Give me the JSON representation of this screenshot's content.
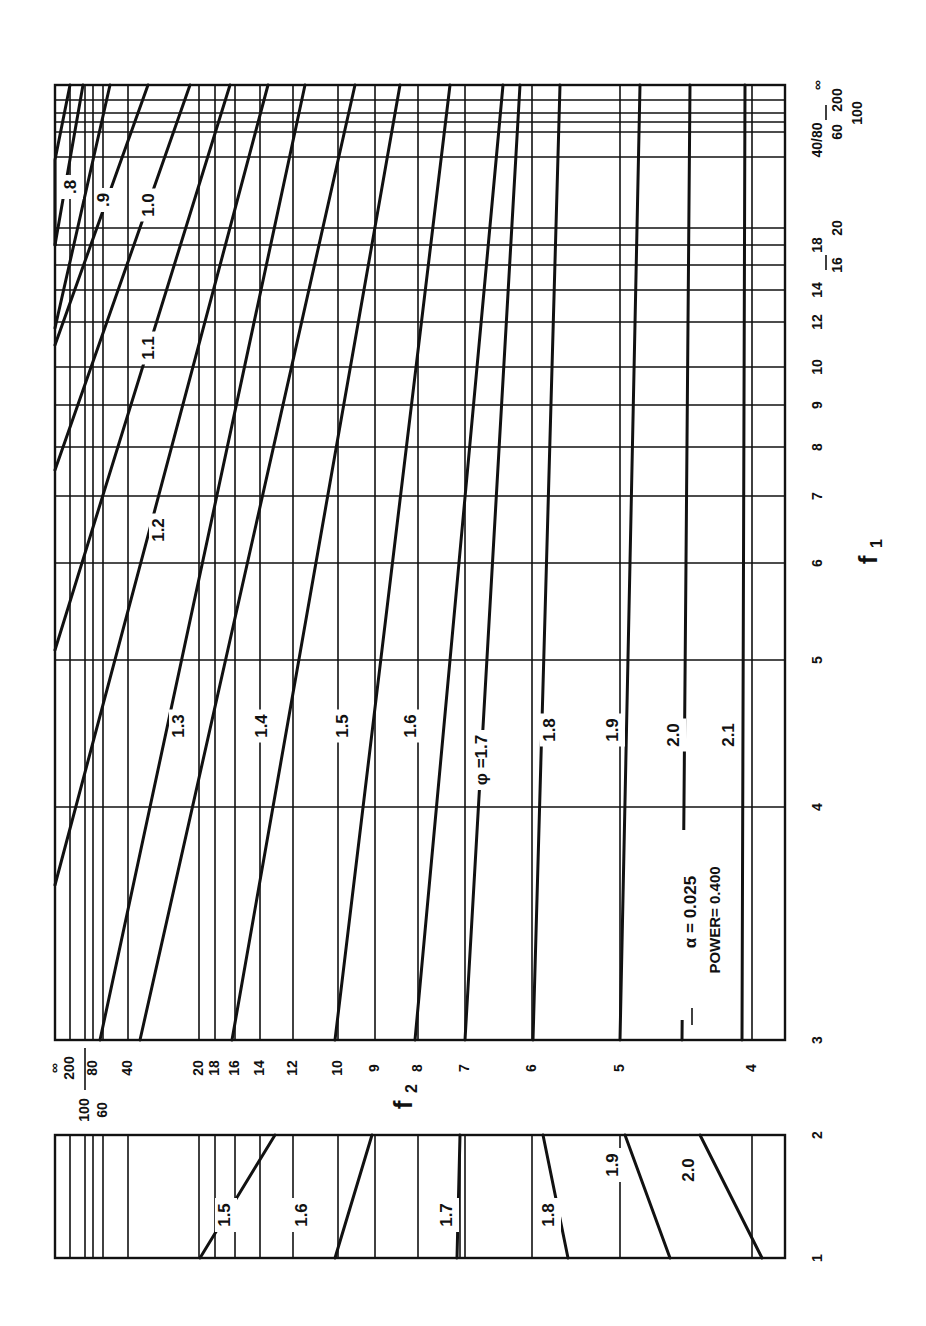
{
  "chart_data": [
    {
      "type": "line",
      "title": "Power nomograph (main panel, f1 from 3 to infinity)",
      "orientation": "rotated 90 degrees clockwise",
      "annotation": [
        "α = 0.025",
        "POWER= 0.400"
      ],
      "xlabel": "f1",
      "ylabel": "f2",
      "f1_ticks": [
        "3",
        "4",
        "5",
        "6",
        "7",
        "8",
        "9",
        "10",
        "12",
        "14",
        "16",
        "18",
        "20",
        "40",
        "60",
        "80",
        "100",
        "200",
        "∞"
      ],
      "f2_ticks": [
        "4",
        "5",
        "6",
        "7",
        "8",
        "9",
        "10",
        "12",
        "14",
        "16",
        "18",
        "20",
        "40",
        "60",
        "80",
        "100",
        "200",
        "∞"
      ],
      "legend_title": "φ",
      "series": [
        {
          "name": "φ=.8",
          "label": ".8"
        },
        {
          "name": "φ=.9",
          "label": ".9"
        },
        {
          "name": "φ=1.0",
          "label": "1.0"
        },
        {
          "name": "φ=1.1",
          "label": "1.1"
        },
        {
          "name": "φ=1.2",
          "label": "1.2"
        },
        {
          "name": "φ=1.3",
          "label": "1.3"
        },
        {
          "name": "φ=1.4",
          "label": "1.4"
        },
        {
          "name": "φ=1.5",
          "label": "1.5"
        },
        {
          "name": "φ=1.6",
          "label": "1.6"
        },
        {
          "name": "φ=1.7",
          "label": "φ=1.7"
        },
        {
          "name": "φ=1.8",
          "label": "1.8"
        },
        {
          "name": "φ=1.9",
          "label": "1.9"
        },
        {
          "name": "φ=2.0",
          "label": "2.0"
        },
        {
          "name": "φ=2.1",
          "label": "2.1"
        }
      ],
      "grid": true
    },
    {
      "type": "line",
      "title": "Power nomograph (lower panel, f1 from 1 to 2)",
      "xlabel": "f1",
      "ylabel": "f2",
      "f1_ticks": [
        "1",
        "2"
      ],
      "series": [
        {
          "name": "φ=1.5",
          "label": "1.5"
        },
        {
          "name": "φ=1.6",
          "label": "1.6"
        },
        {
          "name": "φ=1.7",
          "label": "1.7"
        },
        {
          "name": "φ=1.8",
          "label": "1.8"
        },
        {
          "name": "φ=1.9",
          "label": "1.9"
        },
        {
          "name": "φ=2.0",
          "label": "2.0"
        }
      ],
      "grid": true
    }
  ],
  "render": {
    "main": {
      "x0": 55,
      "x1": 785,
      "y0": 85,
      "y1": 1040
    },
    "main_vgrid_x": [
      70,
      85,
      93,
      103,
      128,
      199,
      215,
      235,
      260,
      293,
      338,
      375,
      418,
      465,
      532,
      620,
      752
    ],
    "main_hgrid_y": [
      100,
      113,
      122,
      132,
      157,
      228,
      245,
      265,
      290,
      322,
      367,
      405,
      447,
      496,
      563,
      660,
      807
    ],
    "main_curves": [
      {
        "label": ".8",
        "pts": [
          [
            55,
            245
          ],
          [
            83,
            85
          ]
        ]
      },
      {
        "label": ".9",
        "pts": [
          [
            55,
            245
          ],
          [
            55,
            245
          ],
          [
            55,
            245
          ],
          [
            55,
            245
          ],
          [
            55,
            160
          ],
          [
            70,
            85
          ]
        ]
      },
      {
        "label": "1.0",
        "pts": [
          [
            55,
            328
          ],
          [
            110,
            85
          ]
        ]
      },
      {
        "label": "1.1",
        "pts": [
          [
            55,
            345
          ],
          [
            148,
            85
          ]
        ]
      },
      {
        "label": "1.2",
        "pts": [
          [
            55,
            470
          ],
          [
            190,
            85
          ]
        ]
      },
      {
        "label": "1.3",
        "pts": [
          [
            55,
            650
          ],
          [
            230,
            85
          ]
        ]
      },
      {
        "label": "1.4",
        "pts": [
          [
            55,
            885
          ],
          [
            268,
            85
          ]
        ]
      },
      {
        "label": "1.5",
        "pts": [
          [
            100,
            1040
          ],
          [
            305,
            85
          ]
        ]
      },
      {
        "label": "1.6",
        "pts": [
          [
            140,
            1040
          ],
          [
            355,
            85
          ]
        ]
      },
      {
        "label": "1.7",
        "pts": [
          [
            232,
            1040
          ],
          [
            400,
            85
          ]
        ]
      },
      {
        "label": "1.8",
        "pts": [
          [
            335,
            1040
          ],
          [
            450,
            85
          ]
        ]
      },
      {
        "label": "1.9",
        "pts": [
          [
            415,
            1040
          ],
          [
            503,
            85
          ]
        ]
      },
      {
        "label": "2.0",
        "pts": [
          [
            465,
            1040
          ],
          [
            520,
            85
          ]
        ]
      },
      {
        "label": "2.1",
        "pts": [
          [
            533,
            1040
          ],
          [
            560,
            85
          ]
        ]
      },
      {
        "label": "2.2",
        "pts": [
          [
            620,
            1040
          ],
          [
            640,
            85
          ]
        ]
      },
      {
        "label": "2.3",
        "pts": [
          [
            682,
            1040
          ],
          [
            690,
            85
          ]
        ]
      },
      {
        "label": "2.4",
        "pts": [
          [
            742,
            1040
          ],
          [
            745,
            85
          ]
        ]
      }
    ],
    "main_labels": [
      {
        "text": ".8",
        "x": 72,
        "y": 187
      },
      {
        "text": ".9",
        "x": 105,
        "y": 200
      },
      {
        "text": "1.0",
        "x": 150,
        "y": 205
      },
      {
        "text": "1.1",
        "x": 150,
        "y": 348
      },
      {
        "text": "1.2",
        "x": 160,
        "y": 530
      },
      {
        "text": "1.3",
        "x": 180,
        "y": 726
      },
      {
        "text": "1.4",
        "x": 263,
        "y": 726
      },
      {
        "text": "1.5",
        "x": 344,
        "y": 726
      },
      {
        "text": "1.6",
        "x": 412,
        "y": 726
      },
      {
        "text": "φ =1.7",
        "x": 483,
        "y": 760
      },
      {
        "text": "1.8",
        "x": 551,
        "y": 730
      },
      {
        "text": "1.9",
        "x": 614,
        "y": 730
      },
      {
        "text": "2.0",
        "x": 675,
        "y": 735
      },
      {
        "text": "2.1",
        "x": 730,
        "y": 735
      }
    ],
    "lower": {
      "x0": 55,
      "x1": 785,
      "y0": 1135,
      "y1": 1258
    },
    "lower_vgrid_x": [
      70,
      85,
      93,
      103,
      128,
      199,
      215,
      235,
      260,
      293,
      338,
      375,
      418,
      460,
      465,
      532,
      620,
      752
    ],
    "lower_curves": [
      {
        "label": "1.5",
        "pts": [
          [
            200,
            1258
          ],
          [
            275,
            1135
          ]
        ]
      },
      {
        "label": "1.6",
        "pts": [
          [
            335,
            1258
          ],
          [
            372,
            1135
          ]
        ]
      },
      {
        "label": "1.7",
        "pts": [
          [
            457,
            1258
          ],
          [
            460,
            1135
          ]
        ]
      },
      {
        "label": "1.8",
        "pts": [
          [
            568,
            1258
          ],
          [
            543,
            1135
          ]
        ]
      },
      {
        "label": "1.9",
        "pts": [
          [
            670,
            1258
          ],
          [
            625,
            1135
          ]
        ]
      },
      {
        "label": "2.0",
        "pts": [
          [
            762,
            1258
          ],
          [
            700,
            1135
          ]
        ]
      }
    ],
    "lower_labels": [
      {
        "text": "1.5",
        "x": 226,
        "y": 1215
      },
      {
        "text": "1.6",
        "x": 303,
        "y": 1215
      },
      {
        "text": "1.7",
        "x": 448,
        "y": 1215
      },
      {
        "text": "1.8",
        "x": 550,
        "y": 1215
      },
      {
        "text": "1.9",
        "x": 614,
        "y": 1165
      },
      {
        "text": "2.0",
        "x": 690,
        "y": 1170
      }
    ],
    "f1_axis_labels": [
      {
        "text": "3",
        "x": 818,
        "y": 1040
      },
      {
        "text": "4",
        "x": 818,
        "y": 807
      },
      {
        "text": "5",
        "x": 818,
        "y": 660
      },
      {
        "text": "6",
        "x": 818,
        "y": 563
      },
      {
        "text": "7",
        "x": 818,
        "y": 496
      },
      {
        "text": "8",
        "x": 818,
        "y": 447
      },
      {
        "text": "9",
        "x": 818,
        "y": 405
      },
      {
        "text": "10",
        "x": 818,
        "y": 367
      },
      {
        "text": "12",
        "x": 818,
        "y": 322
      },
      {
        "text": "14",
        "x": 818,
        "y": 290
      },
      {
        "text": "16",
        "x": 838,
        "y": 265
      },
      {
        "text": "18",
        "x": 818,
        "y": 245
      },
      {
        "text": "20",
        "x": 838,
        "y": 228
      },
      {
        "text": "40/80",
        "x": 818,
        "y": 140
      },
      {
        "text": "60",
        "x": 838,
        "y": 132
      },
      {
        "text": "100",
        "x": 858,
        "y": 113
      },
      {
        "text": "200",
        "x": 838,
        "y": 100
      },
      {
        "text": "∞",
        "x": 818,
        "y": 85
      }
    ],
    "f1_lower_labels": [
      {
        "text": "2",
        "x": 818,
        "y": 1135
      },
      {
        "text": "1",
        "x": 818,
        "y": 1258
      }
    ],
    "f2_axis_labels": [
      {
        "text": "∞",
        "x": 55,
        "y": 1058
      },
      {
        "text": "200",
        "x": 70,
        "y": 1058
      },
      {
        "text": "80",
        "x": 93,
        "y": 1058
      },
      {
        "text": "40",
        "x": 128,
        "y": 1058
      },
      {
        "text": "20",
        "x": 199,
        "y": 1058
      },
      {
        "text": "18",
        "x": 215,
        "y": 1058
      },
      {
        "text": "16",
        "x": 235,
        "y": 1058
      },
      {
        "text": "14",
        "x": 260,
        "y": 1058
      },
      {
        "text": "12",
        "x": 293,
        "y": 1058
      },
      {
        "text": "10",
        "x": 338,
        "y": 1058
      },
      {
        "text": "9",
        "x": 375,
        "y": 1058
      },
      {
        "text": "8",
        "x": 418,
        "y": 1058
      },
      {
        "text": "7",
        "x": 465,
        "y": 1058
      },
      {
        "text": "6",
        "x": 532,
        "y": 1058
      },
      {
        "text": "5",
        "x": 620,
        "y": 1058
      },
      {
        "text": "4",
        "x": 752,
        "y": 1058
      },
      {
        "text": "100",
        "x": 85,
        "y": 1100
      },
      {
        "text": "60",
        "x": 103,
        "y": 1100
      }
    ],
    "f1_title": {
      "text": "f",
      "sub": "1",
      "x": 870,
      "y": 560
    },
    "f2_title": {
      "text": "f",
      "sub": "2",
      "x": 405,
      "y": 1105
    },
    "annotation": {
      "alpha": "α   = 0.025",
      "power": "POWER= 0.400",
      "x1": 692,
      "x2": 712,
      "y": 920
    }
  }
}
